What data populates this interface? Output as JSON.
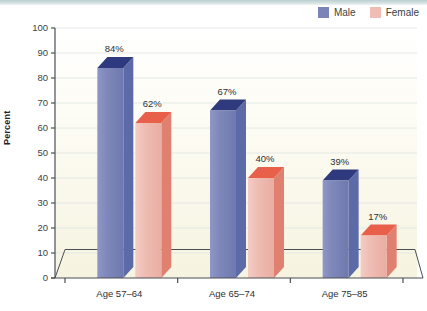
{
  "chart_data": {
    "type": "bar",
    "title": "",
    "subtitle": "",
    "xlabel": "",
    "ylabel": "Percent",
    "categories": [
      "Age 57–64",
      "Age 65–74",
      "Age 75–85"
    ],
    "series": [
      {
        "name": "Male",
        "color": "#7b84b8",
        "top_color": "#2e3a7d",
        "side_color": "#5c6aa8",
        "values": [
          84,
          67,
          39
        ],
        "labels": [
          "84%",
          "67%",
          "39%"
        ]
      },
      {
        "name": "Female",
        "color": "#efbdb4",
        "top_color": "#e8604a",
        "side_color": "#e08070",
        "values": [
          62,
          40,
          17
        ],
        "labels": [
          "62%",
          "40%",
          "17%"
        ]
      }
    ],
    "ylim": [
      0,
      100
    ],
    "yticks": [
      0,
      10,
      20,
      30,
      40,
      50,
      60,
      70,
      80,
      90,
      100
    ],
    "ytick_labels": [
      "0",
      "10",
      "20",
      "30",
      "40",
      "50",
      "60",
      "70",
      "80",
      "90",
      "100"
    ],
    "grid": true,
    "legend_position": "top-right",
    "style": "3d-columns"
  },
  "legend": {
    "entries": [
      {
        "label": "Male",
        "color": "#7b84b8"
      },
      {
        "label": "Female",
        "color": "#efbdb4"
      }
    ]
  },
  "axes": {
    "y_title": "Percent"
  },
  "colors": {
    "male": "#7b84b8",
    "female": "#efbdb4",
    "male_top": "#2e3a7d",
    "female_top": "#e8604a",
    "plot_background_top": "#ffffff",
    "plot_background_bottom": "#f7f4e3",
    "axis_line": "#4a4f55",
    "gridline": "#e3e9e4",
    "top_strip": "#b9cdd0"
  }
}
